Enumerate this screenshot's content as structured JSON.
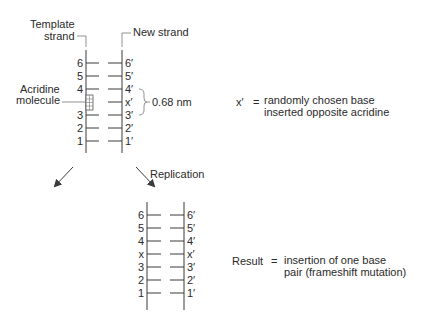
{
  "top_diagram": {
    "template_label_line1": "Template",
    "template_label_line2": "strand",
    "new_strand_label": "New strand",
    "acridine_label_line1": "Acridine",
    "acridine_label_line2": "molecule",
    "distance_label": "0.68 nm",
    "template_bases": [
      "6",
      "5",
      "4",
      "3",
      "2",
      "1"
    ],
    "new_bases": [
      "6′",
      "5′",
      "4′",
      "x′",
      "3′",
      "2′",
      "1′"
    ],
    "legend_symbol": "x′",
    "legend_equals": "=",
    "legend_line1": "randomly chosen base",
    "legend_line2": "inserted opposite acridine"
  },
  "arrows": {
    "replication_label": "Replication"
  },
  "bottom_diagram": {
    "left_bases": [
      "6",
      "5",
      "4",
      "x",
      "3",
      "2",
      "1"
    ],
    "right_bases": [
      "6′",
      "5′",
      "4′",
      "x′",
      "3′",
      "2′",
      "1′"
    ],
    "result_label": "Result",
    "result_equals": "=",
    "result_line1": "insertion of one base",
    "result_line2": "pair (frameshift mutation)"
  }
}
